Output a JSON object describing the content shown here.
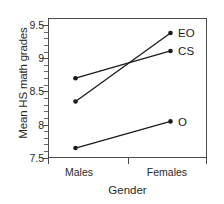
{
  "chart_data": {
    "type": "line",
    "title": "",
    "subtitle": "",
    "xlabel": "Gender",
    "ylabel": "Mean HS math grades",
    "categories": [
      "Males",
      "Females"
    ],
    "x_tick_labels": [
      "Males",
      "Females"
    ],
    "y_tick_labels": [
      "9.5",
      "9",
      "8.5",
      "8",
      "7.5"
    ],
    "y_tick_values": [
      9.5,
      9,
      8.5,
      8,
      7.5
    ],
    "ylim": [
      7.5,
      9.5
    ],
    "grid": false,
    "legend_position": "right-inline-end-of-line",
    "marker": "filled-circle",
    "line_color": "#1a1a1a",
    "series": [
      {
        "name": "EO",
        "label": "EO",
        "values": [
          8.35,
          9.38
        ]
      },
      {
        "name": "CS",
        "label": "CS",
        "values": [
          8.7,
          9.11
        ]
      },
      {
        "name": "O",
        "label": "O",
        "values": [
          7.65,
          8.05
        ]
      }
    ],
    "annotations": []
  },
  "axes": {
    "y_title": "Mean HS math grades",
    "x_title": "Gender",
    "y_labels": [
      "9.5",
      "9",
      "8.5",
      "8",
      "7.5"
    ],
    "x_labels": [
      "Males",
      "Females"
    ]
  },
  "series_labels": {
    "eo": "EO",
    "cs": "CS",
    "o": "O"
  },
  "colors": {
    "line": "#1a1a1a",
    "frame": "#4a4a4a",
    "text": "#2a2a2a",
    "background": "#ffffff"
  }
}
